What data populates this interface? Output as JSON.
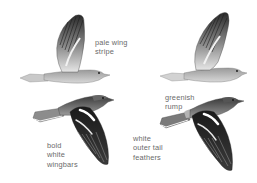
{
  "illustration": {
    "subject": "Chaffinch in flight",
    "birds": [
      {
        "id": "upper-left",
        "view": "wings raised",
        "label": {
          "lines": [
            "pale wing",
            "stripe"
          ]
        }
      },
      {
        "id": "upper-right",
        "view": "wings raised",
        "label": null
      },
      {
        "id": "lower-left",
        "view": "wings lowered",
        "label": {
          "lines": [
            "bold",
            "white",
            "wingbars"
          ]
        }
      },
      {
        "id": "lower-right",
        "view": "wings lowered",
        "labels": [
          {
            "lines": [
              "greenish",
              "rump"
            ]
          },
          {
            "lines": [
              "white",
              "outer tail",
              "feathers"
            ]
          }
        ]
      }
    ]
  },
  "labels": {
    "pale_wing_stripe": [
      "pale wing",
      "stripe"
    ],
    "bold_white_wingbars": [
      "bold",
      "white",
      "wingbars"
    ],
    "greenish_rump": [
      "greenish",
      "rump"
    ],
    "white_outer_tail_feathers": [
      "white",
      "outer tail",
      "feathers"
    ]
  },
  "colors": {
    "background": "#ffffff",
    "label_text": "#6a6a6a",
    "feather_dark": "#1c1c1c",
    "feather_mid": "#7a7a7a",
    "feather_light": "#d8d8d8"
  }
}
